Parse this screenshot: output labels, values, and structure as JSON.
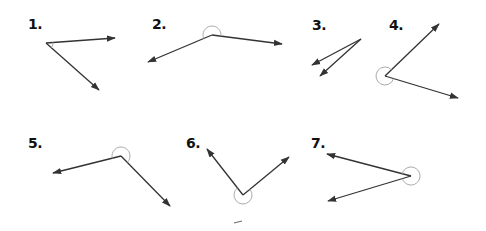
{
  "colors": {
    "line": "#333333",
    "arc": "#aaaaaa",
    "label": "#111111",
    "background": "#ffffff"
  },
  "angles": [
    {
      "number": "1.",
      "label_pos": [
        28,
        17
      ],
      "vertex": [
        46,
        43
      ],
      "ray_a": [
        115,
        38
      ],
      "ray_b": [
        99,
        90
      ],
      "marker": "small-arc",
      "arc_radius": 7
    },
    {
      "number": "2.",
      "label_pos": [
        152,
        17
      ],
      "vertex": [
        212,
        35
      ],
      "ray_a": [
        282,
        44
      ],
      "ray_b": [
        148,
        62
      ],
      "marker": "reflex-arc",
      "arc_radius": 9
    },
    {
      "number": "3.",
      "label_pos": [
        312,
        18
      ],
      "vertex": [
        361,
        39
      ],
      "ray_a": [
        312,
        65
      ],
      "ray_b": [
        320,
        76
      ],
      "marker": "none",
      "arc_radius": 0
    },
    {
      "number": "4.",
      "label_pos": [
        389,
        18
      ],
      "vertex": [
        385,
        76
      ],
      "ray_a": [
        439,
        24
      ],
      "ray_b": [
        458,
        98
      ],
      "marker": "reflex-arc",
      "arc_radius": 9
    },
    {
      "number": "5.",
      "label_pos": [
        28,
        136
      ],
      "vertex": [
        121,
        156
      ],
      "ray_a": [
        53,
        173
      ],
      "ray_b": [
        170,
        206
      ],
      "marker": "reflex-arc",
      "arc_radius": 9
    },
    {
      "number": "6.",
      "label_pos": [
        186,
        136
      ],
      "vertex": [
        243,
        195
      ],
      "ray_a": [
        207,
        149
      ],
      "ray_b": [
        289,
        157
      ],
      "marker": "reflex-arc",
      "arc_radius": 9
    },
    {
      "number": "7.",
      "label_pos": [
        311,
        136
      ],
      "vertex": [
        411,
        176
      ],
      "ray_a": [
        327,
        154
      ],
      "ray_b": [
        328,
        201
      ],
      "marker": "reflex-arc",
      "arc_radius": 9
    }
  ],
  "stray_marks": [
    {
      "from": [
        234,
        223
      ],
      "to": [
        242,
        221
      ]
    }
  ]
}
